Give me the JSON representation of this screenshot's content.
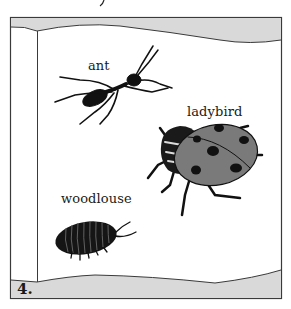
{
  "illustration": {
    "page_number": "4.",
    "colors": {
      "page_fill": "#ffffff",
      "page_edge_fill": "#d9d9d9",
      "frame_stroke": "#3a3a3a",
      "insect_dark": "#111111",
      "ladybird_shell": "#7a7a7a",
      "ladybird_spots": "#111111"
    },
    "creatures": [
      {
        "name": "ant",
        "label": "ant"
      },
      {
        "name": "ladybird",
        "label": "ladybird"
      },
      {
        "name": "woodlouse",
        "label": "woodlouse"
      }
    ]
  }
}
